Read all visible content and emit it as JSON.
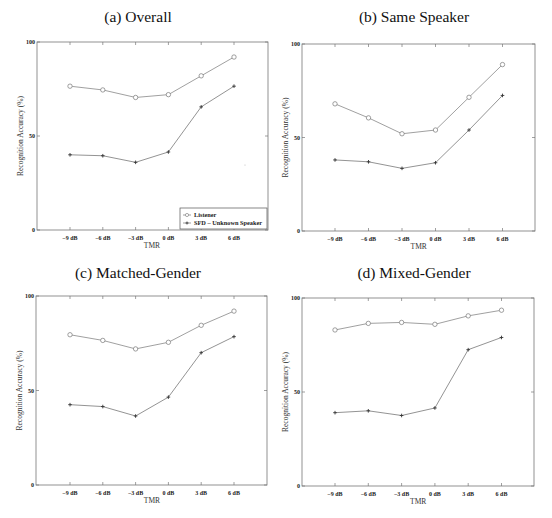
{
  "figure": {
    "xlabel": "TMR",
    "ylabel": "Recognition Accuracy (%)",
    "x_ticks": [
      "−9 dB",
      "−6 dB",
      "−3 dB",
      "0 dB",
      "3 dB",
      "6 dB"
    ],
    "y_ticks": [
      "0",
      "50",
      "100"
    ],
    "legend": [
      "Listener",
      "SFD – Unknown Speaker"
    ]
  },
  "chart_data": [
    {
      "type": "line",
      "title": "(a) Overall",
      "xlabel": "TMR",
      "ylabel": "Recognition Accuracy (%)",
      "categories": [
        "-9 dB",
        "-6 dB",
        "-3 dB",
        "0 dB",
        "3 dB",
        "6 dB"
      ],
      "ylim": [
        0,
        100
      ],
      "grid": false,
      "legend_position": "lower right",
      "series": [
        {
          "name": "Listener",
          "marker": "circle",
          "values": [
            76.5,
            74.5,
            70.5,
            72,
            82,
            92
          ]
        },
        {
          "name": "SFD – Unknown Speaker",
          "marker": "plus",
          "values": [
            40,
            39.5,
            36,
            41.5,
            65.5,
            76.5
          ]
        }
      ]
    },
    {
      "type": "line",
      "title": "(b) Same Speaker",
      "xlabel": "TMR",
      "ylabel": "Recognition Accuracy (%)",
      "categories": [
        "-9 dB",
        "-6 dB",
        "-3 dB",
        "0 dB",
        "3 dB",
        "6 dB"
      ],
      "ylim": [
        0,
        100
      ],
      "grid": false,
      "series": [
        {
          "name": "Listener",
          "marker": "circle",
          "values": [
            68,
            60.5,
            52,
            54,
            71.5,
            89
          ]
        },
        {
          "name": "SFD – Unknown Speaker",
          "marker": "plus",
          "values": [
            38,
            37,
            33.5,
            36.5,
            54,
            72.5
          ]
        }
      ]
    },
    {
      "type": "line",
      "title": "(c) Matched-Gender",
      "xlabel": "TMR",
      "ylabel": "Recognition Accuracy (%)",
      "categories": [
        "-9 dB",
        "-6 dB",
        "-3 dB",
        "0 dB",
        "3 dB",
        "6 dB"
      ],
      "ylim": [
        0,
        100
      ],
      "grid": false,
      "series": [
        {
          "name": "Listener",
          "marker": "circle",
          "values": [
            79.5,
            76.5,
            72,
            75.5,
            84.5,
            92
          ]
        },
        {
          "name": "SFD – Unknown Speaker",
          "marker": "plus",
          "values": [
            42.5,
            41.5,
            36.5,
            46.5,
            70,
            78.5
          ]
        }
      ]
    },
    {
      "type": "line",
      "title": "(d) Mixed-Gender",
      "xlabel": "TMR",
      "ylabel": "Recognition Accuracy (%)",
      "categories": [
        "-9 dB",
        "-6 dB",
        "-3 dB",
        "0 dB",
        "3 dB",
        "6 dB"
      ],
      "ylim": [
        0,
        100
      ],
      "grid": false,
      "series": [
        {
          "name": "Listener",
          "marker": "circle",
          "values": [
            83,
            86.5,
            87,
            86,
            90.5,
            93.5
          ]
        },
        {
          "name": "SFD – Unknown Speaker",
          "marker": "plus",
          "values": [
            39,
            40,
            37.5,
            41.5,
            72.5,
            79
          ]
        }
      ]
    }
  ],
  "colors": {
    "axis": "#777777",
    "listener_line": "#888888",
    "sfd_line": "#777777",
    "text": "#111111"
  }
}
